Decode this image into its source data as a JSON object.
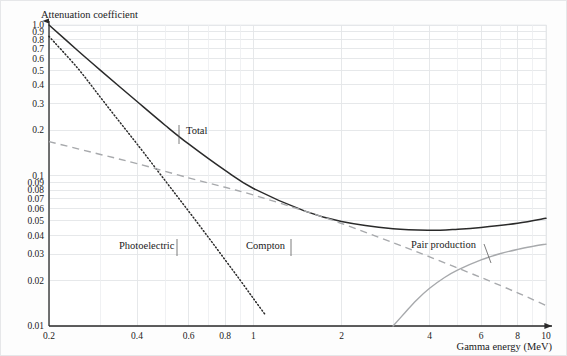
{
  "figure": {
    "background_color": "#fdfdfd",
    "border_color": "#e6e7e9"
  },
  "chart_data": {
    "type": "line",
    "title": "",
    "xlabel": "Gamma energy (MeV)",
    "ylabel": "Attenuation coefficient",
    "xscale": "log",
    "yscale": "log",
    "xlim": [
      0.2,
      10
    ],
    "ylim": [
      0.01,
      1.0
    ],
    "grid": true,
    "legend_position": "inline-annotations",
    "xticks": [
      0.2,
      0.4,
      0.6,
      0.8,
      1,
      2,
      4,
      6,
      8,
      10
    ],
    "xtick_labels": [
      "0.2",
      "0.4",
      "0.6",
      "0.8",
      "1",
      "2",
      "4",
      "6",
      "8",
      "10"
    ],
    "yticks": [
      0.01,
      0.02,
      0.03,
      0.04,
      0.05,
      0.06,
      0.07,
      0.08,
      0.09,
      0.1,
      0.2,
      0.3,
      0.4,
      0.5,
      0.6,
      0.7,
      0.8,
      0.9,
      1.0
    ],
    "ytick_labels": [
      "0.01",
      "0.02",
      "0.03",
      "0.04",
      "0.05",
      "0.06",
      "0.07",
      "0.08",
      "0.09",
      "0.1",
      "0.2",
      "0.3",
      "0.4",
      "0.5",
      "0.6",
      "0.7",
      "0.8",
      "0.9",
      "1.0"
    ],
    "x_minor_gridlines": [
      0.3,
      0.5,
      0.7,
      0.9,
      3,
      5,
      7,
      9
    ],
    "series": [
      {
        "name": "Total",
        "style": "solid",
        "color": "#2a2a2a",
        "x": [
          0.2,
          0.25,
          0.3,
          0.4,
          0.5,
          0.6,
          0.8,
          1.0,
          1.5,
          2.0,
          3.0,
          4.0,
          5.0,
          6.0,
          8.0,
          10.0
        ],
        "y": [
          1.0,
          0.68,
          0.5,
          0.31,
          0.215,
          0.162,
          0.108,
          0.082,
          0.058,
          0.0495,
          0.0442,
          0.0432,
          0.044,
          0.0452,
          0.0482,
          0.052
        ]
      },
      {
        "name": "Photoelectric",
        "style": "dotted",
        "color": "#2a2a2a",
        "x": [
          0.2,
          0.25,
          0.3,
          0.35,
          0.4,
          0.5,
          0.6,
          0.7,
          0.8,
          0.9,
          1.0,
          1.1
        ],
        "y": [
          0.84,
          0.52,
          0.33,
          0.225,
          0.162,
          0.092,
          0.058,
          0.039,
          0.0275,
          0.0202,
          0.0152,
          0.0118
        ]
      },
      {
        "name": "Compton",
        "style": "dashed",
        "color": "#a7a9ac",
        "x": [
          0.2,
          0.3,
          0.4,
          0.6,
          0.8,
          1.0,
          1.5,
          2.0,
          3.0,
          4.0,
          6.0,
          8.0,
          10.0
        ],
        "y": [
          0.168,
          0.138,
          0.12,
          0.0965,
          0.0835,
          0.0742,
          0.058,
          0.048,
          0.0358,
          0.0288,
          0.021,
          0.0166,
          0.0137
        ]
      },
      {
        "name": "Pair production",
        "style": "solid",
        "color": "#a7a9ac",
        "x": [
          3.0,
          3.3,
          3.6,
          4.0,
          4.5,
          5.0,
          6.0,
          7.0,
          8.0,
          9.0,
          10.0
        ],
        "y": [
          0.01,
          0.0123,
          0.0148,
          0.0178,
          0.021,
          0.0236,
          0.0275,
          0.0303,
          0.0323,
          0.0338,
          0.035
        ]
      }
    ],
    "annotations": [
      {
        "text": "Total",
        "label_x": 185,
        "label_y": 133,
        "leader": [
          178,
          124,
          178,
          143
        ]
      },
      {
        "text": "Photoelectric",
        "label_x": 118,
        "label_y": 248,
        "leader": [
          176,
          238,
          176,
          255
        ]
      },
      {
        "text": "Compton",
        "label_x": 245,
        "label_y": 248,
        "leader": [
          290,
          238,
          290,
          255
        ]
      },
      {
        "text": "Pair production",
        "label_x": 410,
        "label_y": 247,
        "leader": [
          483,
          243,
          490,
          262
        ]
      }
    ]
  }
}
